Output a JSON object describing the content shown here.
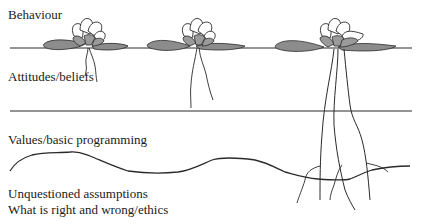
{
  "diagram": {
    "type": "iceberg-style layered model with water-lily illustrations",
    "layers": [
      {
        "label": "Behaviour",
        "level": 1
      },
      {
        "label": "Attitudes/beliefs",
        "level": 2
      },
      {
        "label": "Values/basic programming",
        "level": 3
      },
      {
        "label": "Unquestioned assumptions",
        "level": 4
      },
      {
        "label": "What is right and wrong/ethics",
        "level": 4
      }
    ],
    "illustrations": [
      {
        "name": "lily-shallow-roots",
        "root_depth": "attitudes"
      },
      {
        "name": "lily-medium-roots",
        "root_depth": "attitudes"
      },
      {
        "name": "lily-deep-roots",
        "root_depth": "assumptions"
      }
    ],
    "colors": {
      "line": "#2a2a2a",
      "leaf_fill": "#8c8c8c",
      "petal_fill": "#ffffff",
      "inner_petal_fill": "#9a9a9a"
    }
  }
}
